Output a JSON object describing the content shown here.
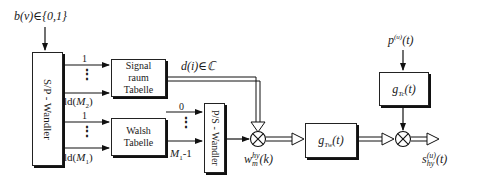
{
  "input_label": "b(ν)∈{0,1}",
  "sp_converter": {
    "label": "S/P - Wandler"
  },
  "ps_converter": {
    "label": "P/S - Wandler"
  },
  "signal_table": {
    "line1": "Signal",
    "line2": "raum",
    "line3": "Tabelle"
  },
  "walsh_table": {
    "line1": "Walsh",
    "line2": "Tabelle"
  },
  "sp_outputs_upper": {
    "first": "1",
    "dots": "⋮",
    "last_prefix": "ld(",
    "last_var": "M",
    "last_sub": "2",
    "last_suffix": ")"
  },
  "sp_outputs_lower": {
    "first": "1",
    "dots": "⋮",
    "last_prefix": "ld(",
    "last_var": "M",
    "last_sub": "1",
    "last_suffix": ")"
  },
  "ps_inputs": {
    "first": "0",
    "dots": "⋮",
    "last_var": "M",
    "last_sub": "1",
    "last_suffix": "-1"
  },
  "symbol_label": {
    "text": "d(i)∈ℂ"
  },
  "walsh_signal_label": {
    "base": "w",
    "sup": "hy",
    "sub": "m",
    "arg": "(k)"
  },
  "g_tw_filter": {
    "base": "g",
    "sub": "Tw",
    "arg": "(t)"
  },
  "g_tc_filter": {
    "base": "g",
    "sub": "Tc",
    "arg": "(t)"
  },
  "pn_label": {
    "base": "p",
    "sup": "(u)",
    "arg": "(t)"
  },
  "output_label": {
    "base": "s",
    "sup": "(u)",
    "sub": "hy",
    "arg": "(t)"
  },
  "multiplier_symbol": "⊗"
}
